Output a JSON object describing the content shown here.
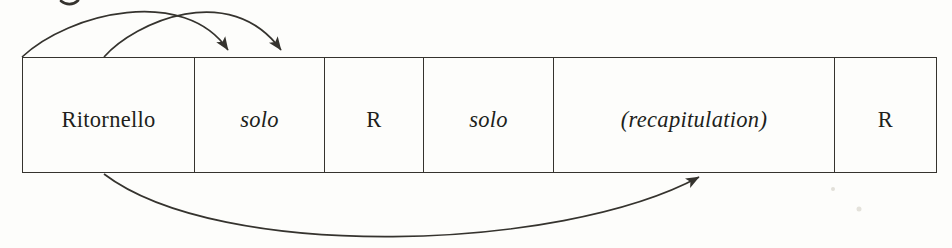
{
  "diagram": {
    "kind": "ritornello-form-diagram",
    "boxes": [
      {
        "label": "Ritornello",
        "style": "roman"
      },
      {
        "label": "solo",
        "style": "italic"
      },
      {
        "label": "R",
        "style": "roman"
      },
      {
        "label": "solo",
        "style": "italic"
      },
      {
        "label": "(recapitulation)",
        "style": "italic"
      },
      {
        "label": "R",
        "style": "roman"
      }
    ],
    "arrows": [
      {
        "from": "Ritornello",
        "to": "solo",
        "edge": "top"
      },
      {
        "from": "Ritornello",
        "to": "solo",
        "edge": "top"
      },
      {
        "from": "Ritornello",
        "to": "(recapitulation)",
        "edge": "bottom"
      }
    ],
    "colors": {
      "background": "#fdfdfb",
      "line": "#35332e",
      "text": "#211f1b"
    }
  }
}
